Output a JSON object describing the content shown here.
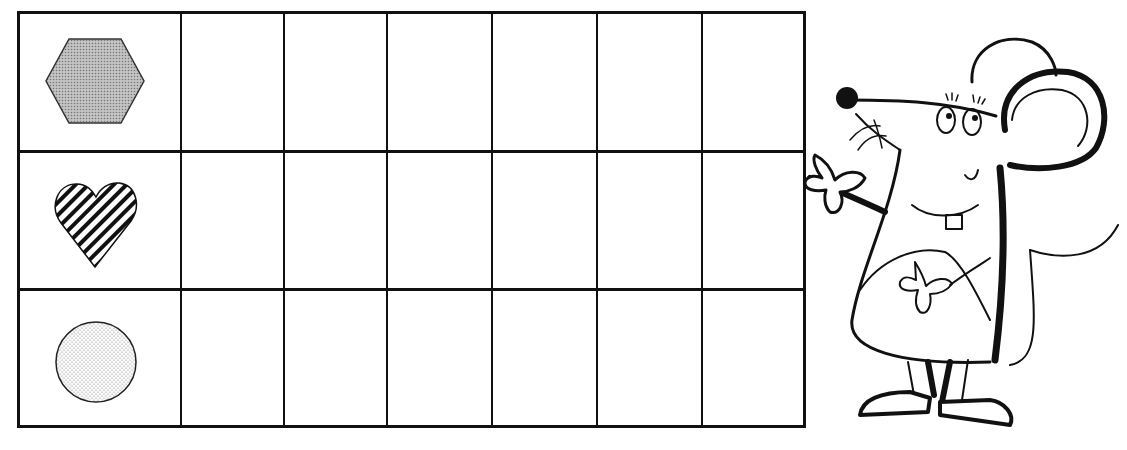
{
  "worksheet": {
    "grid": {
      "rows": 3,
      "columns": 7,
      "row_shapes": [
        {
          "shape": "hexagon",
          "fill": "gray-dotted",
          "color": "#b5b5b5"
        },
        {
          "shape": "heart",
          "fill": "diagonal-stripes",
          "color": "#111111"
        },
        {
          "shape": "circle",
          "fill": "light-dotted",
          "color": "#e6e6e6"
        }
      ],
      "empty_cells_per_row": 6
    },
    "illustration": {
      "character": "mouse",
      "pose": "waving",
      "style": "black-and-white line art"
    }
  }
}
